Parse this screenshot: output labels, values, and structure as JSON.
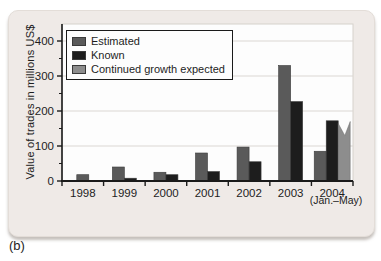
{
  "figure_label": "(b)",
  "colors": {
    "estimated": "#5a5a5a",
    "known": "#1d1d1d",
    "continued": "#8d8d8d",
    "card_bg": "#efeae7",
    "plot_bg": "#fdfdfd",
    "grid": "#dbd7d3",
    "axis": "#1a1a1a",
    "text": "#1d1d1d"
  },
  "chart_data": {
    "type": "bar",
    "title": "",
    "xlabel": "",
    "ylabel": "Value of trades in millions US$",
    "ylim": [
      0,
      400
    ],
    "yticks": [
      0,
      100,
      200,
      300,
      400
    ],
    "minor_tick_interval": 50,
    "grid": true,
    "legend_position": "top-left",
    "categories": [
      "1998",
      "1999",
      "2000",
      "2001",
      "2002",
      "2003",
      "2004"
    ],
    "category_note": {
      "index": 6,
      "text": "(Jan.–May)"
    },
    "series": [
      {
        "name": "Estimated",
        "color_key": "estimated",
        "values": [
          18,
          40,
          25,
          80,
          97,
          330,
          85
        ]
      },
      {
        "name": "Known",
        "color_key": "known",
        "values": [
          0,
          8,
          18,
          27,
          55,
          227,
          172
        ]
      },
      {
        "name": "Continued growth expected",
        "color_key": "continued",
        "jagged_top": true,
        "values": [
          null,
          null,
          null,
          null,
          null,
          null,
          170
        ]
      }
    ]
  }
}
